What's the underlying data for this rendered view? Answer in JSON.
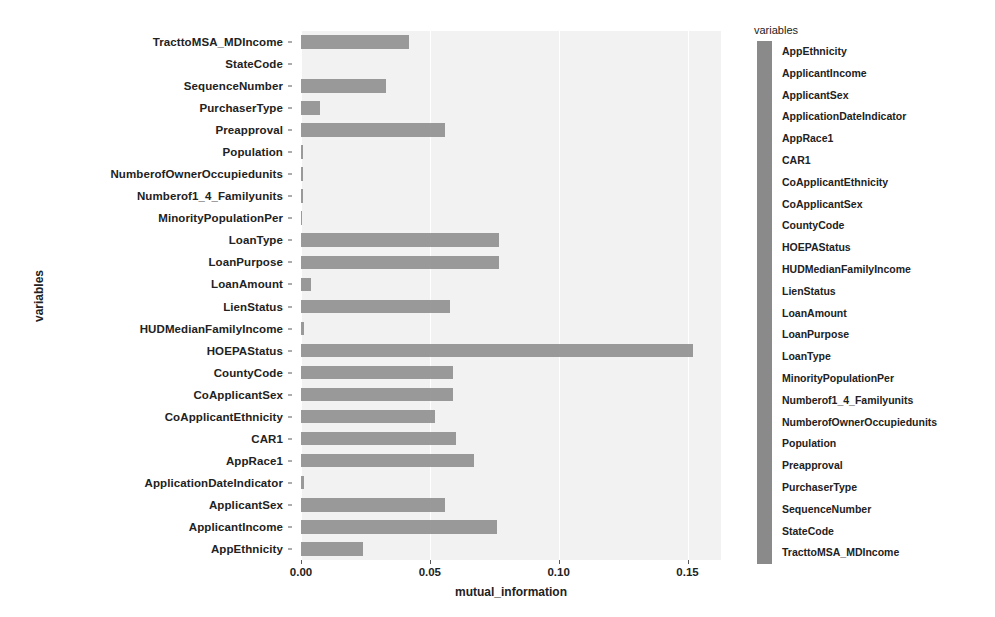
{
  "chart_data": {
    "type": "bar",
    "orientation": "horizontal",
    "title": "",
    "xlabel": "mutual_information",
    "ylabel": "variables",
    "xlim": [
      0.0,
      0.163
    ],
    "xticks": [
      "0.00",
      "0.05",
      "0.10",
      "0.15"
    ],
    "xtick_values": [
      0.0,
      0.05,
      0.1,
      0.15
    ],
    "grid": true,
    "bar_color": "#8c8c8c",
    "plot_bg": "#f2f2f2",
    "categories": [
      "TracttoMSA_MDIncome",
      "StateCode",
      "SequenceNumber",
      "PurchaserType",
      "Preapproval",
      "Population",
      "NumberofOwnerOccupiedunits",
      "Numberof1_4_Familyunits",
      "MinorityPopulationPer",
      "LoanType",
      "LoanPurpose",
      "LoanAmount",
      "LienStatus",
      "HUDMedianFamilyIncome",
      "HOEPAStatus",
      "CountyCode",
      "CoApplicantSex",
      "CoApplicantEthnicity",
      "CAR1",
      "AppRace1",
      "ApplicationDateIndicator",
      "ApplicantSex",
      "ApplicantIncome",
      "AppEthnicity"
    ],
    "values": [
      0.042,
      0.0,
      0.033,
      0.0075,
      0.056,
      0.0008,
      0.0006,
      0.0009,
      0.0005,
      0.077,
      0.077,
      0.004,
      0.058,
      0.0012,
      0.152,
      0.059,
      0.059,
      0.052,
      0.06,
      0.067,
      0.0013,
      0.056,
      0.076,
      0.024
    ]
  },
  "legend": {
    "title": "variables",
    "items": [
      "AppEthnicity",
      "ApplicantIncome",
      "ApplicantSex",
      "ApplicationDateIndicator",
      "AppRace1",
      "CAR1",
      "CoApplicantEthnicity",
      "CoApplicantSex",
      "CountyCode",
      "HOEPAStatus",
      "HUDMedianFamilyIncome",
      "LienStatus",
      "LoanAmount",
      "LoanPurpose",
      "LoanType",
      "MinorityPopulationPer",
      "Numberof1_4_Familyunits",
      "NumberofOwnerOccupiedunits",
      "Population",
      "Preapproval",
      "PurchaserType",
      "SequenceNumber",
      "StateCode",
      "TracttoMSA_MDIncome"
    ]
  }
}
